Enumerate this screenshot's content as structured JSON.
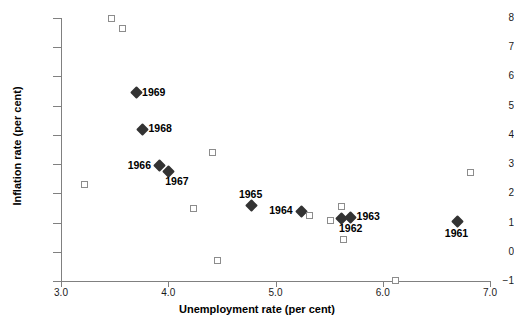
{
  "chart_data": {
    "type": "scatter",
    "title": "",
    "xlabel": "Unemployment rate (per cent)",
    "ylabel": "Inflation rate (per cent)",
    "xlim": [
      3.0,
      7.0
    ],
    "ylim": [
      -1,
      8
    ],
    "xticks": [
      "3.0",
      "4.0",
      "5.0",
      "6.0",
      "7.0"
    ],
    "xtick_values": [
      3.0,
      4.0,
      5.0,
      6.0,
      7.0
    ],
    "yticks": [
      "8",
      "7",
      "6",
      "5",
      "4",
      "3",
      "2",
      "1",
      "0",
      "−1"
    ],
    "ytick_values": [
      8,
      7,
      6,
      5,
      4,
      3,
      2,
      1,
      0,
      -1
    ],
    "grid": false,
    "legend": false,
    "series": [
      {
        "name": "labelled-years",
        "marker": "filled-diamond",
        "color": "#333333",
        "points": [
          {
            "label": "1969",
            "x": 3.7,
            "y": 5.45,
            "label_pos": "right"
          },
          {
            "label": "1968",
            "x": 3.76,
            "y": 4.2,
            "label_pos": "right"
          },
          {
            "label": "1966",
            "x": 3.92,
            "y": 2.95,
            "label_pos": "left"
          },
          {
            "label": "1967",
            "x": 4.0,
            "y": 2.75,
            "label_pos": "below-right"
          },
          {
            "label": "1965",
            "x": 4.78,
            "y": 1.58,
            "label_pos": "above"
          },
          {
            "label": "1964",
            "x": 5.24,
            "y": 1.38,
            "label_pos": "left"
          },
          {
            "label": "1962",
            "x": 5.62,
            "y": 1.15,
            "label_pos": "below-right"
          },
          {
            "label": "1963",
            "x": 5.7,
            "y": 1.18,
            "label_pos": "right"
          },
          {
            "label": "1961",
            "x": 6.7,
            "y": 1.02,
            "label_pos": "below"
          }
        ]
      },
      {
        "name": "unlabelled-observations",
        "marker": "open-square",
        "color": "#8c8c8c",
        "points": [
          {
            "x": 3.48,
            "y": 7.95
          },
          {
            "x": 3.58,
            "y": 7.62
          },
          {
            "x": 3.22,
            "y": 2.3
          },
          {
            "x": 4.42,
            "y": 3.38
          },
          {
            "x": 4.24,
            "y": 1.48
          },
          {
            "x": 4.46,
            "y": -0.3
          },
          {
            "x": 5.32,
            "y": 1.22
          },
          {
            "x": 5.52,
            "y": 1.05
          },
          {
            "x": 5.62,
            "y": 1.52
          },
          {
            "x": 5.64,
            "y": 0.42
          },
          {
            "x": 6.12,
            "y": -1.0
          },
          {
            "x": 6.82,
            "y": 2.7
          }
        ]
      }
    ]
  }
}
